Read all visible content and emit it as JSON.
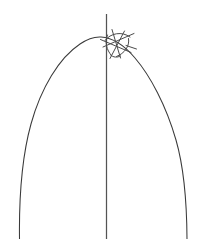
{
  "figure": {
    "title_clipped_text": "fig 4 2014",
    "background_color": "#ffffff",
    "stroke_color": "#3a3a3a",
    "axis_color": "#545454",
    "sketch_color": "#4a4a4a",
    "width": 212,
    "height": 239,
    "elements": [
      {
        "name": "arch-curve",
        "type": "curve",
        "label": "Parabolic arch"
      },
      {
        "name": "vertical-axis",
        "type": "line",
        "label": "Vertical axis"
      },
      {
        "name": "sketch-cluster",
        "type": "strokes",
        "label": "Crossing stroke cluster"
      }
    ],
    "geometry": {
      "arch": {
        "left_base_x": 19,
        "left_base_y": 239,
        "apex_x": 96,
        "apex_y": 38,
        "right_base_x": 187,
        "right_base_y": 239
      },
      "axis": {
        "x": 106,
        "y_top": 14,
        "y_bottom": 239
      },
      "cluster": {
        "center_x": 118,
        "center_y": 42,
        "stroke_count": 9
      }
    }
  }
}
